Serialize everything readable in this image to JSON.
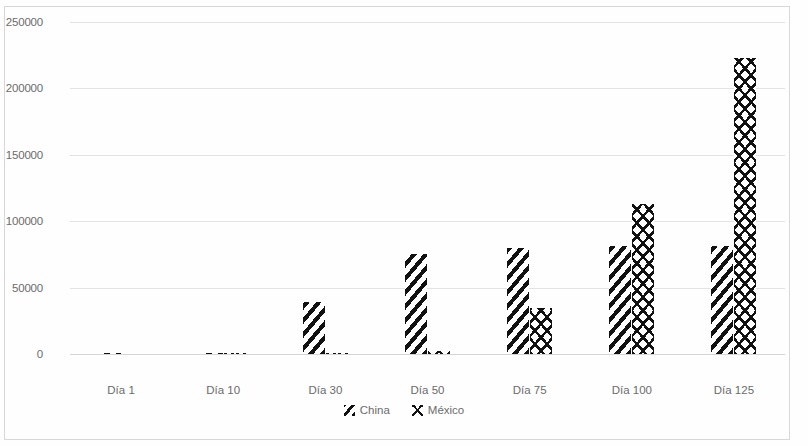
{
  "chart_data": {
    "type": "bar",
    "title": "",
    "subtitle": "",
    "xlabel": "",
    "ylabel": "",
    "categories": [
      "Día 1",
      "Día 10",
      "Día 30",
      "Día 50",
      "Día 75",
      "Día 100",
      "Día 125"
    ],
    "series": [
      {
        "name": "China",
        "values": [
          700,
          900,
          39000,
          75000,
          80000,
          81000,
          81000
        ]
      },
      {
        "name": "México",
        "values": [
          0,
          100,
          300,
          2500,
          35000,
          113000,
          223000
        ]
      }
    ],
    "ylim": [
      0,
      250000
    ],
    "ytick_labels": [
      "250000",
      "200000",
      "150000",
      "100000",
      "50000",
      "0"
    ],
    "ytick_values": [
      250000,
      200000,
      150000,
      100000,
      50000,
      0
    ],
    "grid": true,
    "legend_position": "bottom",
    "legend_entries": [
      "China",
      "México"
    ],
    "colors": {
      "hatch": "#111111",
      "grid": "#e3e3e3",
      "axis": "#d5d5d5",
      "text": "#6b6b6b",
      "background": "#ffffff",
      "border": "#d8d8d8"
    }
  }
}
